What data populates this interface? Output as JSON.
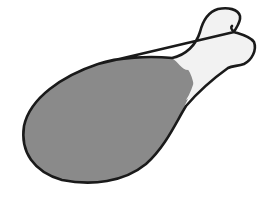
{
  "image": {
    "subject": "chicken drumstick illustration",
    "colors": {
      "background": "#ffffff",
      "meat": "#8a8a8a",
      "bone": "#f2f2f2",
      "outline": "#1a1a1a"
    }
  }
}
